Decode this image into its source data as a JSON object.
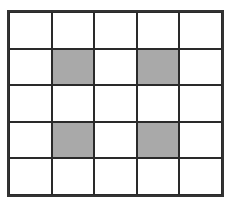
{
  "grid": {
    "rows": 5,
    "cols": 5,
    "fill_color": "#a9a9a9",
    "empty_color": "#ffffff",
    "line_color": "#2a2a2a",
    "shaded": [
      [
        1,
        1
      ],
      [
        1,
        3
      ],
      [
        3,
        1
      ],
      [
        3,
        3
      ]
    ]
  }
}
